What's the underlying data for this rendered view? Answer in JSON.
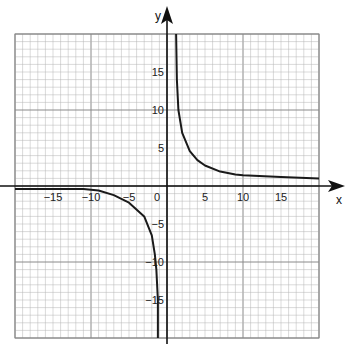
{
  "chart_data": {
    "type": "line",
    "title": "",
    "xlabel": "x",
    "ylabel": "y",
    "xlim": [
      -20,
      20
    ],
    "ylim": [
      -20,
      20
    ],
    "grid": true,
    "grid_minor_step": 1,
    "grid_major_step": 5,
    "x_ticks": [
      {
        "value": -15,
        "label": "−15"
      },
      {
        "value": -10,
        "label": "−10"
      },
      {
        "value": -5,
        "label": "−5"
      },
      {
        "value": 0,
        "label": "0"
      },
      {
        "value": 5,
        "label": "5"
      },
      {
        "value": 10,
        "label": "10"
      },
      {
        "value": 15,
        "label": "15"
      }
    ],
    "y_ticks": [
      {
        "value": 15,
        "label": "15"
      },
      {
        "value": 10,
        "label": "10"
      },
      {
        "value": 5,
        "label": "5"
      },
      {
        "value": -5,
        "label": "−5"
      },
      {
        "value": -10,
        "label": "−10"
      },
      {
        "value": -15,
        "label": "−15"
      }
    ],
    "series": [
      {
        "name": "right-branch",
        "points": [
          [
            1.2,
            20
          ],
          [
            1.3,
            14
          ],
          [
            1.5,
            10
          ],
          [
            2,
            7
          ],
          [
            3,
            4.6
          ],
          [
            4,
            3.4
          ],
          [
            5,
            2.7
          ],
          [
            7,
            1.9
          ],
          [
            9,
            1.5
          ],
          [
            10,
            1.4
          ],
          [
            15,
            1.2
          ],
          [
            20,
            1.0
          ]
        ]
      },
      {
        "name": "left-branch",
        "points": [
          [
            -20,
            -0.4
          ],
          [
            -17,
            -0.4
          ],
          [
            -15,
            -0.4
          ],
          [
            -11,
            -0.4
          ],
          [
            -9,
            -0.6
          ],
          [
            -7,
            -1.2
          ],
          [
            -5,
            -2.2
          ],
          [
            -3,
            -4
          ],
          [
            -2,
            -6.5
          ],
          [
            -1.6,
            -9
          ],
          [
            -1.4,
            -11
          ],
          [
            -1.2,
            -15
          ],
          [
            -1.2,
            -20
          ]
        ]
      }
    ],
    "color": "#1a1a1a",
    "grid_color": "#b5b5b5",
    "major_grid_color": "#8a8a8a"
  },
  "axes": {
    "x_label": "x",
    "y_label": "y"
  }
}
